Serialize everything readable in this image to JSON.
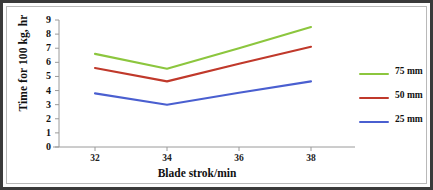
{
  "chart_data": {
    "type": "line",
    "title": "",
    "xlabel": "Blade strok/min",
    "ylabel": "Time for 100 kg, hr",
    "x": [
      32,
      34,
      36,
      38
    ],
    "xticks": [
      "32",
      "34",
      "36",
      "38"
    ],
    "yticks": [
      "0",
      "1",
      "2",
      "3",
      "4",
      "5",
      "6",
      "7",
      "8",
      "9"
    ],
    "xlim": [
      31,
      39
    ],
    "ylim": [
      0,
      9
    ],
    "grid": false,
    "legend_position": "right",
    "series": [
      {
        "name": "75 mm",
        "color": "#8cc63e",
        "values": [
          6.6,
          5.55,
          7.0,
          8.5
        ]
      },
      {
        "name": "50 mm",
        "color": "#c0392b",
        "values": [
          5.6,
          4.65,
          5.9,
          7.1
        ]
      },
      {
        "name": "25 mm",
        "color": "#4a5fd0",
        "values": [
          3.8,
          3.0,
          3.85,
          4.65
        ]
      }
    ]
  },
  "legend": {
    "items": [
      {
        "label": "75 mm",
        "color": "#8cc63e"
      },
      {
        "label": "50 mm",
        "color": "#c0392b"
      },
      {
        "label": "25 mm",
        "color": "#4a5fd0"
      }
    ]
  }
}
